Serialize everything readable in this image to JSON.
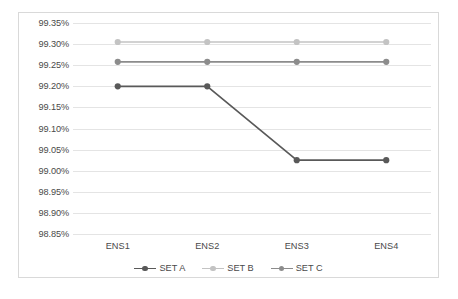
{
  "chart_data": {
    "type": "line",
    "title": "",
    "xlabel": "",
    "ylabel": "",
    "categories": [
      "ENS1",
      "ENS2",
      "ENS3",
      "ENS4"
    ],
    "ylim": [
      98.85,
      99.35
    ],
    "ytick_labels": [
      "99.35%",
      "99.30%",
      "99.25%",
      "99.20%",
      "99.15%",
      "99.10%",
      "99.05%",
      "99.00%",
      "98.95%",
      "98.90%",
      "98.85%"
    ],
    "ytick_values": [
      99.35,
      99.3,
      99.25,
      99.2,
      99.15,
      99.1,
      99.05,
      99.0,
      98.95,
      98.9,
      98.85
    ],
    "grid": true,
    "value_suffix": "%",
    "legend_position": "bottom",
    "series": [
      {
        "name": "SET A",
        "color": "#595959",
        "values": [
          99.2,
          99.2,
          99.025,
          99.025
        ]
      },
      {
        "name": "SET B",
        "color": "#c3c3c3",
        "values": [
          99.305,
          99.305,
          99.305,
          99.305
        ]
      },
      {
        "name": "SET C",
        "color": "#8c8c8c",
        "values": [
          99.258,
          99.258,
          99.258,
          99.258
        ]
      }
    ]
  },
  "style": {
    "gridline_color": "#e4e4e4",
    "border_color": "#d9d9d9",
    "axis_text_color": "#4a4a4a",
    "plot_background": "#ffffff"
  }
}
